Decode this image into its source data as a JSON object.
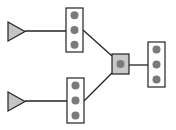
{
  "diagram": {
    "width": 176,
    "height": 130,
    "colors": {
      "background": "#ffffff",
      "stroke": "#222222",
      "box_fill": "#ffffff",
      "dot_fill": "#7a7a7a",
      "triangle_fill": "#c4c4c4",
      "hub_fill": "#c8c8c8"
    },
    "nodes": [
      {
        "id": "source-top",
        "shape": "triangle",
        "x": 8,
        "y": 22,
        "w": 17,
        "h": 19
      },
      {
        "id": "source-bottom",
        "shape": "triangle",
        "x": 8,
        "y": 92,
        "w": 17,
        "h": 19
      },
      {
        "id": "port-box-top",
        "shape": "port-box",
        "x": 66,
        "y": 8,
        "w": 17,
        "h": 44,
        "ports": 3
      },
      {
        "id": "port-box-bottom",
        "shape": "port-box",
        "x": 67,
        "y": 78,
        "w": 17,
        "h": 45,
        "ports": 3
      },
      {
        "id": "hub",
        "shape": "square",
        "x": 112,
        "y": 54,
        "w": 17,
        "h": 20
      },
      {
        "id": "port-box-right",
        "shape": "port-box",
        "x": 148,
        "y": 42,
        "w": 17,
        "h": 45,
        "ports": 3
      }
    ],
    "edges": [
      {
        "from": "source-top",
        "to": "port-box-top",
        "x1": 25,
        "y1": 31,
        "x2": 66,
        "y2": 31
      },
      {
        "from": "source-bottom",
        "to": "port-box-bottom",
        "x1": 25,
        "y1": 101,
        "x2": 67,
        "y2": 101
      },
      {
        "from": "port-box-top",
        "to": "hub",
        "x1": 83,
        "y1": 30,
        "x2": 112,
        "y2": 56
      },
      {
        "from": "port-box-bottom",
        "to": "hub",
        "x1": 84,
        "y1": 101,
        "x2": 112,
        "y2": 73
      },
      {
        "from": "hub",
        "to": "port-box-right",
        "x1": 129,
        "y1": 65,
        "x2": 148,
        "y2": 65
      }
    ]
  }
}
